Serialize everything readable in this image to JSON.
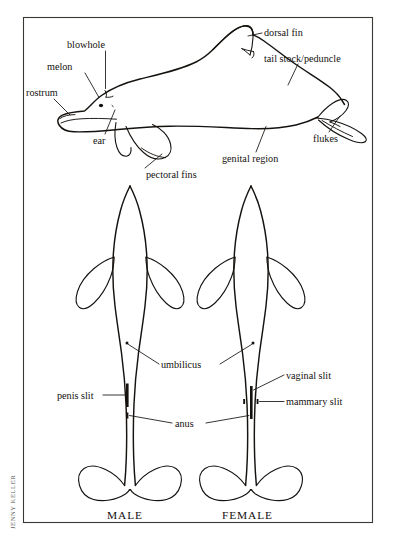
{
  "figure": {
    "credit": "JENNY KELLER",
    "frame": {
      "border_color": "#3a3734",
      "background": "#ffffff"
    },
    "ink_color": "#15120f"
  },
  "lateral_view": {
    "name": "lateral-dolphin-view",
    "labels": [
      {
        "id": "blowhole",
        "text": "blowhole"
      },
      {
        "id": "melon",
        "text": "melon"
      },
      {
        "id": "rostrum",
        "text": "rostrum"
      },
      {
        "id": "ear",
        "text": "ear"
      },
      {
        "id": "dorsal_fin",
        "text": "dorsal fin"
      },
      {
        "id": "tail_stock",
        "text": "tail stock/peduncle"
      },
      {
        "id": "genital_region",
        "text": "genital region"
      },
      {
        "id": "flukes",
        "text": "flukes"
      },
      {
        "id": "pectoral_fins",
        "text": "pectoral fins"
      }
    ]
  },
  "ventral_views": {
    "name": "ventral-dolphin-views",
    "male": {
      "caption": "MALE",
      "features": [
        "umbilicus",
        "penis slit",
        "anus"
      ]
    },
    "female": {
      "caption": "FEMALE",
      "features": [
        "umbilicus",
        "vaginal slit",
        "mammary slit",
        "anus"
      ]
    },
    "labels": [
      {
        "id": "umbilicus",
        "text": "umbilicus"
      },
      {
        "id": "penis_slit",
        "text": "penis slit"
      },
      {
        "id": "anus",
        "text": "anus"
      },
      {
        "id": "vaginal_slit",
        "text": "vaginal slit"
      },
      {
        "id": "mammary_slit",
        "text": "mammary slit"
      }
    ]
  }
}
